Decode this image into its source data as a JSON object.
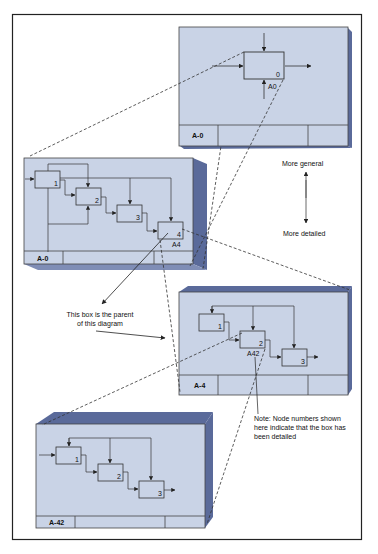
{
  "colors": {
    "panel_fill": "#c9d3e6",
    "panel_side": "#5a6a9a",
    "panel_top": "#7f8db6",
    "line": "#333333",
    "frame": "#222222",
    "background": "#ffffff"
  },
  "panels": [
    {
      "id": "A-0-top",
      "footer_label": "A-0",
      "boxes": [
        {
          "number": "0",
          "node": "A0"
        }
      ]
    },
    {
      "id": "A-0",
      "footer_label": "A-0",
      "boxes": [
        {
          "number": "1"
        },
        {
          "number": "2"
        },
        {
          "number": "3"
        },
        {
          "number": "4",
          "node": "A4"
        }
      ]
    },
    {
      "id": "A-4",
      "footer_label": "A-4",
      "boxes": [
        {
          "number": "1"
        },
        {
          "number": "2",
          "node": "A42"
        },
        {
          "number": "3"
        }
      ]
    },
    {
      "id": "A-42",
      "footer_label": "A-42",
      "boxes": [
        {
          "number": "1"
        },
        {
          "number": "2"
        },
        {
          "number": "3"
        }
      ]
    }
  ],
  "annotations": {
    "more_general": "More general",
    "more_detailed": "More detailed",
    "parent_note_line1": "This box is the parent",
    "parent_note_line2": "of this diagram",
    "node_note_line1": "Note:  Node numbers shown",
    "node_note_line2": "here indicate that the box has",
    "node_note_line3": "been detailed"
  }
}
